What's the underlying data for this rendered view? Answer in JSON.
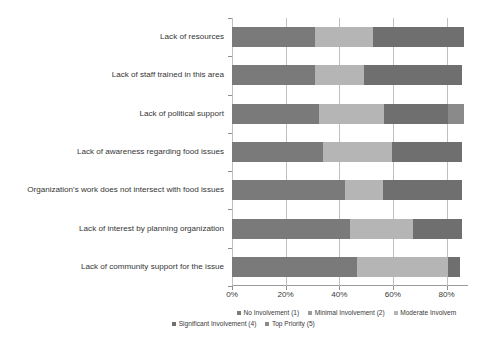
{
  "chart_data": {
    "type": "bar",
    "orientation": "horizontal",
    "stacked": true,
    "stack_mode": "percent",
    "title": "",
    "subtitle": "",
    "xlabel": "",
    "ylabel": "",
    "xlim": [
      0,
      88
    ],
    "xticks": [
      0,
      20,
      40,
      60,
      80
    ],
    "xticklabels": [
      "0%",
      "20%",
      "40%",
      "60%",
      "80%"
    ],
    "grid": "vertical",
    "legend_position": "bottom",
    "categories": [
      "Lack of resources",
      "Lack of staff trained in this area",
      "Lack of political support",
      "Lack of awareness regarding food issues",
      "Organization's work does not intersect with food issues",
      "Lack of interest by planning organization",
      "Lack of community support for the issue"
    ],
    "series": [
      {
        "name": "No Involvement (1)",
        "color": "#7a7a7a",
        "values": [
          30.8,
          31.0,
          32.5,
          34.0,
          42.2,
          44.0,
          46.7
        ]
      },
      {
        "name": "Minimal Involvement (2)",
        "color": "#9d9d9d",
        "values": [
          0,
          0,
          0,
          0,
          0,
          0,
          0
        ]
      },
      {
        "name": "Moderate Involvem",
        "color": "#b5b5b5",
        "values": [
          21.8,
          18.3,
          24.3,
          25.5,
          14.2,
          23.6,
          33.7
        ]
      },
      {
        "name": "Significant Involvement (4)",
        "color": "#6f6f6f",
        "values": [
          33.8,
          36.3,
          23.6,
          26.1,
          29.2,
          18.0,
          4.6
        ]
      },
      {
        "name": "Top Priority (5)",
        "color": "#8a8a8a",
        "values": [
          0,
          0,
          6.0,
          0,
          0,
          0,
          0
        ]
      }
    ],
    "bar_totals": [
      86.4,
      85.6,
      86.4,
      85.6,
      85.6,
      85.6,
      85.0
    ],
    "legend_entries": [
      {
        "label": "No Involvement (1)",
        "color": "#7a7a7a"
      },
      {
        "label": "Minimal Involvement (2)",
        "color": "#9d9d9d"
      },
      {
        "label": "Moderate Involvem",
        "color": "#b5b5b5"
      },
      {
        "label": "Significant Involvement (4)",
        "color": "#6f6f6f"
      },
      {
        "label": "Top Priority (5)",
        "color": "#8a8a8a"
      }
    ]
  },
  "colors": {
    "background": "#ffffff",
    "gridline": "#bfbfbf",
    "axis": "#9a9a9a",
    "text": "#3a3a3a"
  }
}
